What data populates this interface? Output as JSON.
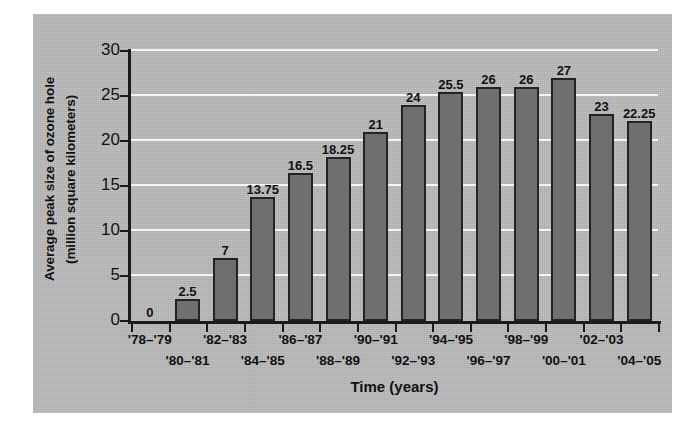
{
  "chart_data": {
    "type": "bar",
    "title": "",
    "xlabel": "Time (years)",
    "ylabel": "Average peak size of ozone hole (million square kilometers)",
    "ylabel_lines": [
      "Average peak size of ozone hole",
      "(million square kilometers)"
    ],
    "categories": [
      "'78–'79",
      "'80–'81",
      "'82–'83",
      "'84–'85",
      "'86–'87",
      "'88–'89",
      "'90–'91",
      "'92–'93",
      "'94–'95",
      "'96–'97",
      "'98–'99",
      "'00–'01",
      "'02–'03",
      "'04–'05"
    ],
    "values": [
      0,
      2.5,
      7,
      13.75,
      16.5,
      18.25,
      21,
      24,
      25.5,
      26,
      26,
      27,
      23,
      22.25
    ],
    "value_labels": [
      "0",
      "2.5",
      "7",
      "13.75",
      "16.5",
      "18.25",
      "21",
      "24",
      "25.5",
      "26",
      "26",
      "27",
      "23",
      "22.25"
    ],
    "ylim": [
      0,
      30
    ],
    "yticks": [
      0,
      5,
      10,
      15,
      20,
      25,
      30
    ],
    "ytick_labels": [
      "0",
      "5",
      "10",
      "15",
      "20",
      "25",
      "30"
    ],
    "grid": true,
    "gridline_color": "#f4f4f4",
    "legend": null,
    "colors": {
      "bar_fill": "#6f6f6f",
      "bar_edge": "#232323",
      "panel_background": "#b9b9b9",
      "axis": "#1a1a1a",
      "text": "#111111",
      "figure_background": "#ffffff"
    }
  }
}
